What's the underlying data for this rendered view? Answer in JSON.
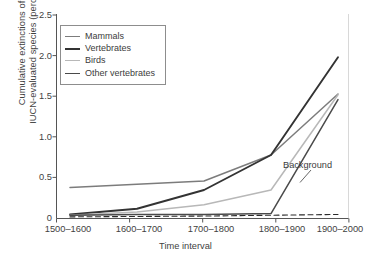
{
  "chart_data": {
    "type": "line",
    "title": "",
    "xlabel": "Time interval",
    "ylabel": "Cumulative extinctions of IUCN-evaluated species (percent)",
    "ylabel_line1": "Cumulative extinctions of",
    "ylabel_line2": "IUCN-evaluated species (percent)",
    "categories": [
      "1500–1600",
      "1600–1700",
      "1700–1800",
      "1800–1900",
      "1900–2000"
    ],
    "ylim": [
      0,
      2.5
    ],
    "yticks": [
      "0",
      "0.5",
      "1.0",
      "1.5",
      "2.0",
      "2.5"
    ],
    "ytick_values": [
      0,
      0.5,
      1.0,
      1.5,
      2.0,
      2.5
    ],
    "grid": false,
    "legend_position": "upper left",
    "series": [
      {
        "name": "Mammals",
        "color": "#7c7c7c",
        "width": 1.5,
        "dash": "none",
        "values": [
          0.38,
          0.42,
          0.46,
          0.78,
          1.53
        ]
      },
      {
        "name": "Vertebrates",
        "color": "#333333",
        "width": 1.9,
        "dash": "none",
        "values": [
          0.05,
          0.12,
          0.35,
          0.78,
          1.98
        ]
      },
      {
        "name": "Birds",
        "color": "#b8b8b8",
        "width": 1.5,
        "dash": "none",
        "values": [
          0.04,
          0.08,
          0.17,
          0.35,
          1.52
        ]
      },
      {
        "name": "Other vertebrates",
        "color": "#4a4a4a",
        "width": 1.5,
        "dash": "none",
        "values": [
          0.04,
          0.05,
          0.05,
          0.06,
          1.46
        ]
      }
    ],
    "annotations": [
      {
        "name": "background",
        "label": "Background",
        "series_name": "Background rate",
        "color": "#2b2b2b",
        "dash": "dashed",
        "values": [
          0.02,
          0.025,
          0.03,
          0.04,
          0.05
        ]
      }
    ]
  },
  "legend": {
    "items": [
      {
        "label": "Mammals"
      },
      {
        "label": "Vertebrates"
      },
      {
        "label": "Birds"
      },
      {
        "label": "Other vertebrates"
      }
    ]
  },
  "axes": {
    "y_title_line1": "Cumulative extinctions of",
    "y_title_line2": "IUCN-evaluated species (percent)",
    "x_title": "Time interval",
    "y_ticks": [
      "2.5",
      "2.0",
      "1.5",
      "1.0",
      "0.5",
      "0"
    ],
    "x_ticks": [
      "1500–1600",
      "1600–1700",
      "1700–1800",
      "1800–1900",
      "1900–2000"
    ]
  },
  "annotation": {
    "background_label": "Background"
  },
  "colors": {
    "mammals": "#7c7c7c",
    "vertebrates": "#333333",
    "birds": "#b8b8b8",
    "other_vertebrates": "#4a4a4a",
    "axis": "#555555",
    "background_line": "#2b2b2b"
  }
}
